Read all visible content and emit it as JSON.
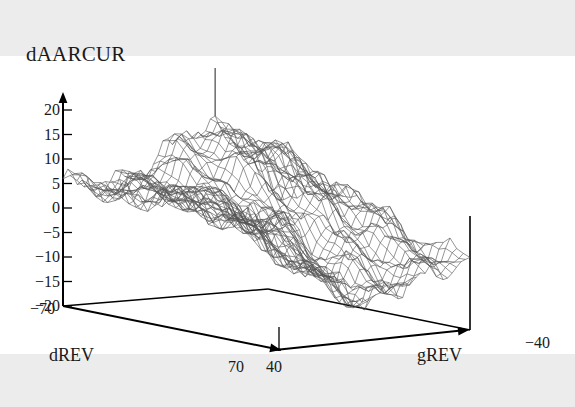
{
  "figure": {
    "background_color": "#ececec",
    "plot_background_color": "#ffffff",
    "line_color": "#555555",
    "axis_color": "#000000",
    "text_color": "#1a1a1a"
  },
  "chart_data": {
    "type": "surface",
    "title": "dAARCUR",
    "zlabel": "dAARCUR",
    "xlabel": "dREV",
    "ylabel": "gREV",
    "grid": true,
    "legend": "none",
    "projection": "3d-wireframe",
    "xlim": [
      -70,
      70
    ],
    "ylim": [
      40,
      -40
    ],
    "zlim": [
      -20,
      22
    ],
    "x_ticks": [
      -70,
      70
    ],
    "x_tick_labels": [
      "−70",
      "70"
    ],
    "y_ticks": [
      40,
      -40
    ],
    "y_tick_labels": [
      "40",
      "−40"
    ],
    "z_ticks": [
      20,
      15,
      10,
      5,
      0,
      -5,
      -10,
      -15,
      -20
    ],
    "z_tick_labels": [
      "20",
      "15",
      "10",
      "5",
      "0",
      "−5",
      "−10",
      "−15",
      "−20"
    ],
    "annotations": [
      {
        "name": "peak-needle",
        "description": "thin vertical line rising above the highest ridge point"
      }
    ],
    "x": [
      -70,
      -60,
      -50,
      -40,
      -30,
      -20,
      -10,
      0,
      10,
      20,
      30,
      40,
      50,
      60,
      70
    ],
    "y": [
      40,
      30,
      20,
      10,
      0,
      -10,
      -20,
      -30,
      -40
    ],
    "z": [
      [
        5,
        4,
        3,
        2,
        1,
        0,
        -1,
        -2,
        -3
      ],
      [
        5,
        4,
        3,
        2,
        1,
        0,
        -2,
        -4,
        -5
      ],
      [
        6,
        5,
        4,
        2,
        0,
        -2,
        -4,
        -6,
        -8
      ],
      [
        7,
        6,
        4,
        2,
        0,
        -3,
        -6,
        -9,
        -11
      ],
      [
        9,
        7,
        5,
        2,
        -1,
        -4,
        -8,
        -12,
        -14
      ],
      [
        11,
        9,
        6,
        2,
        -2,
        -6,
        -10,
        -14,
        -16
      ],
      [
        14,
        12,
        8,
        3,
        -2,
        -7,
        -12,
        -16,
        -17
      ],
      [
        17,
        15,
        11,
        5,
        -1,
        -7,
        -12,
        -16,
        -18
      ],
      [
        20,
        18,
        14,
        7,
        0,
        -6,
        -11,
        -15,
        -17
      ],
      [
        21,
        20,
        16,
        9,
        2,
        -4,
        -9,
        -13,
        -15
      ],
      [
        22,
        21,
        18,
        11,
        4,
        -2,
        -7,
        -11,
        -13
      ],
      [
        21,
        20,
        18,
        12,
        6,
        0,
        -5,
        -9,
        -11
      ],
      [
        19,
        18,
        16,
        12,
        7,
        2,
        -3,
        -7,
        -9
      ],
      [
        16,
        15,
        14,
        11,
        7,
        3,
        -1,
        -5,
        -7
      ],
      [
        13,
        12,
        11,
        9,
        6,
        3,
        0,
        -3,
        -5
      ]
    ]
  }
}
